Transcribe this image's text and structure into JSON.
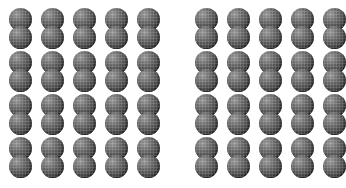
{
  "figure": {
    "type": "object-array-illustration",
    "background_color": "#ffffff",
    "object_color": "#4b4b4b",
    "object_shape": "double-sphere",
    "groups": [
      {
        "id": "left-group",
        "label": "left array",
        "rows": 4,
        "columns": 5,
        "count": 20,
        "spheres_per_object": 2,
        "total_spheres": 40,
        "origin_x": 9,
        "origin_y": 8,
        "col_pitch": 32,
        "row_pitch": 43
      },
      {
        "id": "right-group",
        "label": "right array",
        "rows": 4,
        "columns": 5,
        "count": 20,
        "spheres_per_object": 2,
        "total_spheres": 40,
        "origin_x": 195,
        "origin_y": 8,
        "col_pitch": 32,
        "row_pitch": 43
      }
    ],
    "gap_between_groups": 35
  }
}
